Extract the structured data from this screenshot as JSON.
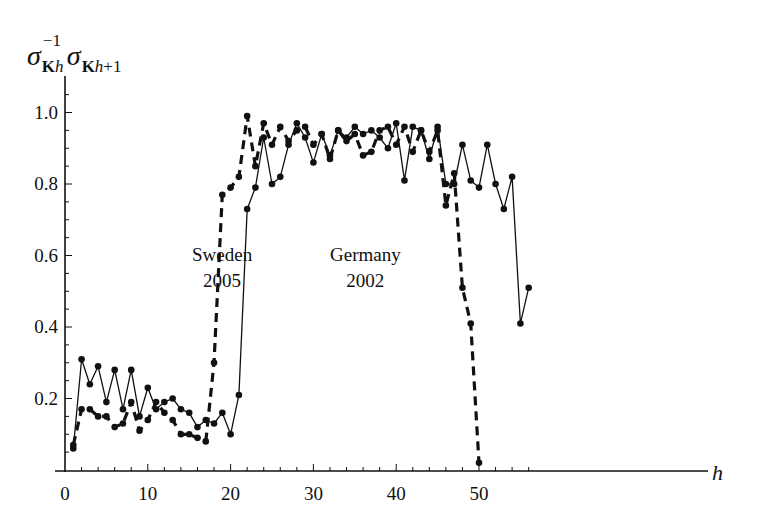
{
  "chart_data": {
    "type": "line",
    "title": "",
    "xlabel": "h",
    "ylabel": "σ_Kh^-1 σ_Kh+1",
    "xlim": [
      0,
      57
    ],
    "ylim": [
      0,
      1.08
    ],
    "xticks": [
      0,
      10,
      20,
      30,
      40,
      50
    ],
    "yticks": [
      0.2,
      0.4,
      0.6,
      0.8,
      1.0
    ],
    "ytick_labels": [
      "0.2",
      "0.4",
      "0.6",
      "0.8",
      "1.0"
    ],
    "xtick_labels": [
      "0",
      "10",
      "20",
      "30",
      "40",
      "50"
    ],
    "grid": false,
    "legend": "inline annotations",
    "series": [
      {
        "name": "Germany 2002",
        "style": "solid",
        "x": [
          1,
          2,
          3,
          4,
          5,
          6,
          7,
          8,
          9,
          10,
          11,
          12,
          13,
          14,
          15,
          16,
          17,
          18,
          19,
          20,
          21,
          22,
          23,
          24,
          25,
          26,
          27,
          28,
          29,
          30,
          31,
          32,
          33,
          34,
          35,
          36,
          37,
          38,
          39,
          40,
          41,
          42,
          43,
          44,
          45,
          46,
          47,
          48,
          49,
          50,
          51,
          52,
          53,
          54,
          55,
          56
        ],
        "values": [
          0.06,
          0.31,
          0.24,
          0.29,
          0.19,
          0.28,
          0.17,
          0.28,
          0.15,
          0.23,
          0.17,
          0.19,
          0.2,
          0.17,
          0.16,
          0.12,
          0.14,
          0.13,
          0.16,
          0.1,
          0.21,
          0.73,
          0.79,
          0.93,
          0.8,
          0.82,
          0.91,
          0.97,
          0.93,
          0.86,
          0.94,
          0.88,
          0.95,
          0.93,
          0.96,
          0.94,
          0.95,
          0.93,
          0.9,
          0.97,
          0.81,
          0.96,
          0.95,
          0.87,
          0.96,
          0.8,
          0.8,
          0.91,
          0.81,
          0.79,
          0.91,
          0.8,
          0.73,
          0.82,
          0.41,
          0.51
        ]
      },
      {
        "name": "Sweden 2005",
        "style": "dashed",
        "x": [
          1,
          2,
          3,
          4,
          5,
          6,
          7,
          8,
          9,
          10,
          11,
          12,
          13,
          14,
          15,
          16,
          17,
          18,
          19,
          20,
          21,
          22,
          23,
          24,
          25,
          26,
          27,
          28,
          29,
          30,
          31,
          32,
          33,
          34,
          35,
          36,
          37,
          38,
          39,
          40,
          41,
          42,
          43,
          44,
          45,
          46,
          47,
          48,
          49,
          50
        ],
        "values": [
          0.07,
          0.17,
          0.17,
          0.15,
          0.15,
          0.12,
          0.13,
          0.19,
          0.11,
          0.14,
          0.19,
          0.16,
          0.14,
          0.1,
          0.1,
          0.09,
          0.08,
          0.3,
          0.77,
          0.79,
          0.82,
          0.99,
          0.85,
          0.97,
          0.91,
          0.96,
          0.92,
          0.95,
          0.96,
          0.91,
          0.94,
          0.87,
          0.95,
          0.92,
          0.94,
          0.88,
          0.89,
          0.95,
          0.96,
          0.91,
          0.96,
          0.89,
          0.95,
          0.89,
          0.95,
          0.74,
          0.83,
          0.51,
          0.41,
          0.02
        ]
      }
    ],
    "annotations": [
      {
        "line1": "Sweden",
        "line2": "2005",
        "target": "Sweden 2005"
      },
      {
        "line1": "Germany",
        "line2": "2002",
        "target": "Germany 2002"
      }
    ]
  },
  "labels": {
    "ylabel_sigma": "σ",
    "ylabel_sup": "−1",
    "ylabel_sub1_bold": "K",
    "ylabel_sub1_italic": "h",
    "ylabel_sub2_bold": "K",
    "ylabel_sub2_italic": "h",
    "ylabel_sub2_rest": "+1",
    "xlabel": "h",
    "sweden_line1": "Sweden",
    "sweden_line2": "2005",
    "germany_line1": "Germany",
    "germany_line2": "2002"
  }
}
